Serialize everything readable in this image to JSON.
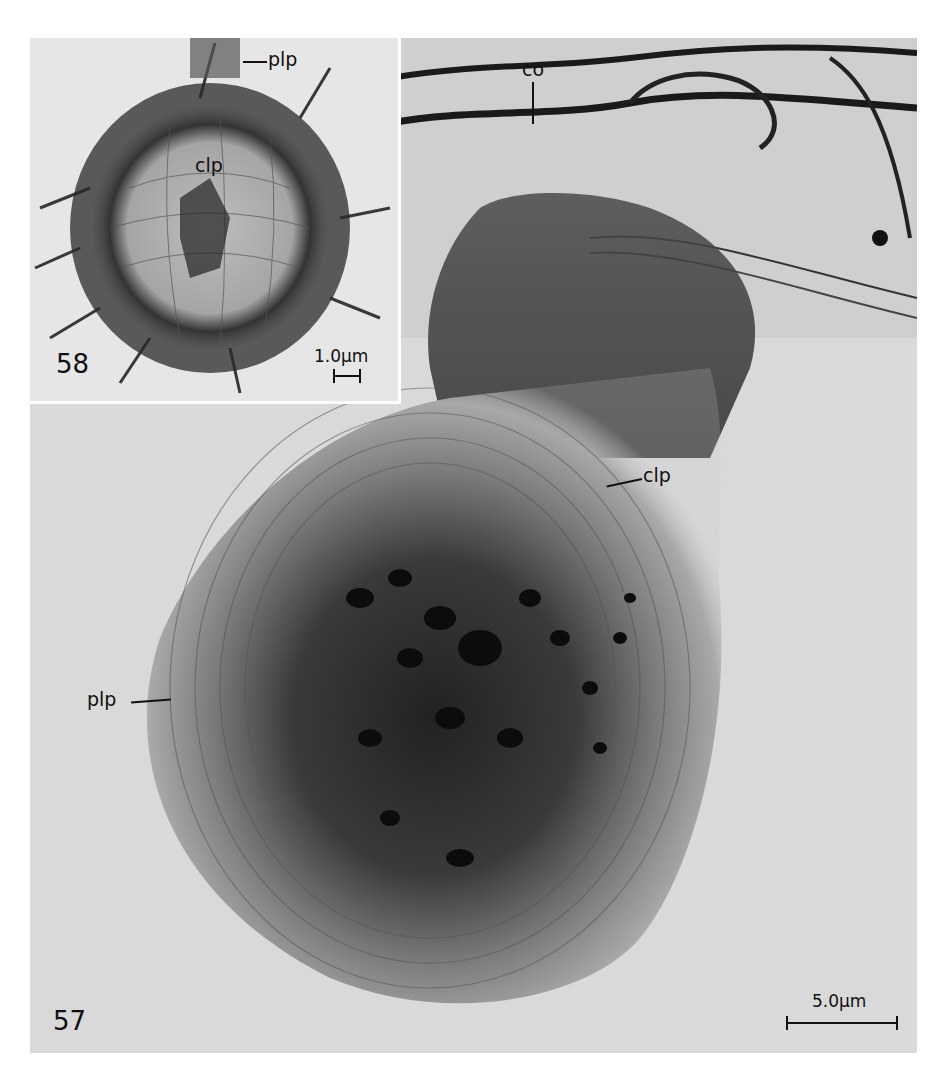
{
  "figure": {
    "type": "electron micrograph plate",
    "colors": {
      "background": "#ffffff",
      "panel_light": "#d9d9d9",
      "tissue_dark": "#111111",
      "label_ink": "#111111"
    },
    "panels": [
      {
        "number": "57",
        "labels": {
          "co": "co",
          "clp": "clp",
          "plp": "plp"
        },
        "scale_bar": "5.0µm"
      },
      {
        "number": "58",
        "labels": {
          "plp": "plp",
          "clp": "clp"
        },
        "scale_bar": "1.0µm"
      }
    ]
  }
}
